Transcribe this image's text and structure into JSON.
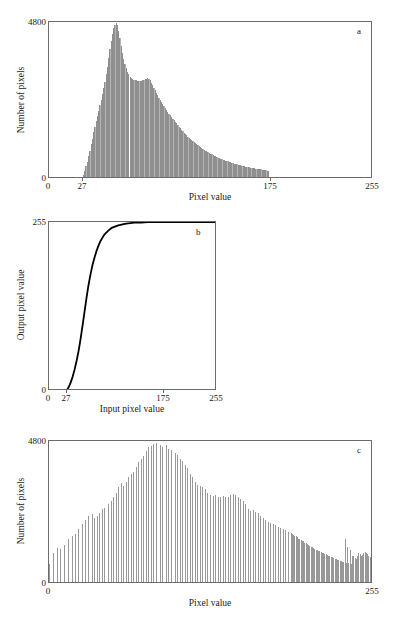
{
  "figure": {
    "panels": [
      "a",
      "b",
      "c"
    ],
    "bar_color": "#989898",
    "axis_color": "#6b6b6b",
    "curve_color": "#000000"
  },
  "chart_data": [
    {
      "id": "a",
      "type": "bar",
      "title": "",
      "panel_label": "a",
      "xlabel": "Pixel value",
      "ylabel": "Number of pixels",
      "xlim": [
        0,
        255
      ],
      "ylim": [
        0,
        4800
      ],
      "xticks": [
        0,
        27,
        175,
        255
      ],
      "xticklabels": [
        "0",
        "27",
        "175",
        "255"
      ],
      "yticks": [
        0,
        4800
      ],
      "yticklabels": [
        "0",
        "4800"
      ],
      "grid": false,
      "legend": "none",
      "description": "Original image histogram: values confined between 27 and 175, sharp peak near 53 reaching nearly 4800, secondary shoulder near 78, long tail to 175.",
      "x": [
        0,
        1,
        2,
        3,
        4,
        5,
        6,
        7,
        8,
        9,
        10,
        11,
        12,
        13,
        14,
        15,
        16,
        17,
        18,
        19,
        20,
        21,
        22,
        23,
        24,
        25,
        26,
        27,
        28,
        29,
        30,
        31,
        32,
        33,
        34,
        35,
        36,
        37,
        38,
        39,
        40,
        41,
        42,
        43,
        44,
        45,
        46,
        47,
        48,
        49,
        50,
        51,
        52,
        53,
        54,
        55,
        56,
        57,
        58,
        59,
        60,
        61,
        62,
        63,
        64,
        65,
        66,
        67,
        68,
        69,
        70,
        71,
        72,
        73,
        74,
        75,
        76,
        77,
        78,
        79,
        80,
        81,
        82,
        83,
        84,
        85,
        86,
        87,
        88,
        89,
        90,
        91,
        92,
        93,
        94,
        95,
        96,
        97,
        98,
        99,
        100,
        101,
        102,
        103,
        104,
        105,
        106,
        107,
        108,
        109,
        110,
        111,
        112,
        113,
        114,
        115,
        116,
        117,
        118,
        119,
        120,
        121,
        122,
        123,
        124,
        125,
        126,
        127,
        128,
        129,
        130,
        131,
        132,
        133,
        134,
        135,
        136,
        137,
        138,
        139,
        140,
        141,
        142,
        143,
        144,
        145,
        146,
        147,
        148,
        149,
        150,
        151,
        152,
        153,
        154,
        155,
        156,
        157,
        158,
        159,
        160,
        161,
        162,
        163,
        164,
        165,
        166,
        167,
        168,
        169,
        170,
        171,
        172,
        173,
        174,
        175,
        176,
        177,
        178,
        179,
        180,
        181,
        182,
        183,
        184,
        185,
        186,
        187,
        188,
        189,
        190,
        191,
        192,
        193,
        194,
        195,
        196,
        197,
        198,
        199,
        200,
        201,
        202,
        203,
        204,
        205,
        206,
        207,
        208,
        209,
        210,
        211,
        212,
        213,
        214,
        215,
        216,
        217,
        218,
        219,
        220,
        221,
        222,
        223,
        224,
        225,
        226,
        227,
        228,
        229,
        230,
        231,
        232,
        233,
        234,
        235,
        236,
        237,
        238,
        239,
        240,
        241,
        242,
        243,
        244,
        245,
        246,
        247,
        248,
        249,
        250,
        251,
        252,
        253,
        254,
        255
      ],
      "values": [
        0,
        0,
        0,
        0,
        0,
        0,
        0,
        0,
        0,
        0,
        0,
        0,
        0,
        0,
        0,
        0,
        0,
        0,
        0,
        0,
        0,
        0,
        0,
        0,
        0,
        0,
        0,
        60,
        190,
        330,
        470,
        640,
        820,
        1010,
        1190,
        1380,
        1560,
        1720,
        1880,
        2050,
        2220,
        2400,
        2560,
        2750,
        2950,
        3180,
        3420,
        3680,
        3950,
        4220,
        4440,
        4600,
        4720,
        4780,
        4700,
        4520,
        4300,
        4070,
        3850,
        3660,
        3500,
        3370,
        3260,
        3180,
        3110,
        3060,
        3030,
        3010,
        3000,
        2990,
        2985,
        2980,
        2980,
        2985,
        2995,
        3010,
        3030,
        3050,
        3060,
        3040,
        2990,
        2920,
        2840,
        2760,
        2680,
        2600,
        2530,
        2460,
        2390,
        2320,
        2250,
        2190,
        2130,
        2070,
        2010,
        1960,
        1910,
        1860,
        1810,
        1760,
        1710,
        1660,
        1610,
        1560,
        1510,
        1465,
        1420,
        1375,
        1330,
        1290,
        1250,
        1215,
        1180,
        1145,
        1110,
        1080,
        1050,
        1020,
        990,
        960,
        930,
        900,
        872,
        845,
        820,
        795,
        770,
        745,
        720,
        700,
        680,
        660,
        640,
        622,
        604,
        588,
        572,
        556,
        540,
        525,
        510,
        496,
        482,
        468,
        455,
        442,
        430,
        418,
        406,
        395,
        384,
        373,
        362,
        352,
        342,
        333,
        324,
        315,
        306,
        298,
        290,
        282,
        275,
        268,
        261,
        254,
        247,
        240,
        233,
        226,
        219,
        212,
        205,
        198,
        190,
        0,
        0,
        0,
        0,
        0,
        0,
        0,
        0,
        0,
        0,
        0,
        0,
        0,
        0,
        0,
        0,
        0,
        0,
        0,
        0,
        0,
        0,
        0,
        0,
        0,
        0,
        0,
        0,
        0,
        0,
        0,
        0,
        0,
        0,
        0,
        0,
        0,
        0,
        0,
        0,
        0,
        0,
        0,
        0,
        0,
        0,
        0,
        0,
        0,
        0,
        0,
        0,
        0,
        0,
        0,
        0,
        0,
        0,
        0,
        0,
        0,
        0,
        0,
        0,
        0,
        0,
        0,
        0,
        0,
        0,
        0,
        0,
        0,
        0,
        0,
        0,
        0,
        0,
        0,
        0
      ]
    },
    {
      "id": "b",
      "type": "line",
      "title": "",
      "panel_label": "b",
      "xlabel": "Input pixel value",
      "ylabel": "Output pixel value",
      "xlim": [
        0,
        255
      ],
      "ylim": [
        0,
        255
      ],
      "xticks": [
        0,
        27,
        175,
        255
      ],
      "xticklabels": [
        "0",
        "27",
        "175",
        "255"
      ],
      "yticks": [
        0,
        255
      ],
      "yticklabels": [
        "0",
        "255"
      ],
      "grid": false,
      "legend": "none",
      "description": "Cumulative distribution / transfer function: flat at 0 until 27, steep sigmoidal rise, saturating at 255 by input value 175.",
      "x": [
        0,
        5,
        10,
        15,
        20,
        25,
        27,
        30,
        33,
        36,
        39,
        42,
        45,
        48,
        51,
        54,
        57,
        60,
        63,
        66,
        69,
        72,
        75,
        78,
        81,
        84,
        87,
        90,
        95,
        100,
        105,
        110,
        115,
        120,
        130,
        140,
        150,
        160,
        170,
        175,
        185,
        200,
        220,
        240,
        255
      ],
      "values": [
        0,
        0,
        0,
        0,
        0,
        0,
        1,
        6,
        13,
        22,
        33,
        46,
        61,
        79,
        99,
        120,
        141,
        160,
        176,
        190,
        201,
        211,
        219,
        226,
        231,
        236,
        239,
        242,
        246,
        248,
        250,
        251,
        252,
        253,
        254,
        254,
        255,
        255,
        255,
        255,
        255,
        255,
        255,
        255,
        255
      ]
    },
    {
      "id": "c",
      "type": "bar",
      "title": "",
      "panel_label": "c",
      "xlabel": "Pixel value",
      "ylabel": "Number of pixels",
      "xlim": [
        0,
        255
      ],
      "ylim": [
        0,
        4800
      ],
      "xticks": [
        0,
        255
      ],
      "xticklabels": [
        "0",
        "255"
      ],
      "yticks": [
        0,
        4800
      ],
      "yticklabels": [
        "0",
        "4800"
      ],
      "grid": false,
      "legend": "none",
      "description": "Histogram-equalised image: sparse comb of tall isolated spikes spread across the whole 0-255 range, rising to a maximum near 4700 around value 95, then tapering, with a dense band of short bars after about value 215.",
      "x": [
        0,
        1,
        2,
        3,
        4,
        5,
        6,
        7,
        8,
        9,
        10,
        11,
        12,
        13,
        14,
        15,
        16,
        17,
        18,
        19,
        20,
        21,
        22,
        23,
        24,
        25,
        26,
        27,
        28,
        29,
        30,
        31,
        32,
        33,
        34,
        35,
        36,
        37,
        38,
        39,
        40,
        41,
        42,
        43,
        44,
        45,
        46,
        47,
        48,
        49,
        50,
        51,
        52,
        53,
        54,
        55,
        56,
        57,
        58,
        59,
        60,
        61,
        62,
        63,
        64,
        65,
        66,
        67,
        68,
        69,
        70,
        71,
        72,
        73,
        74,
        75,
        76,
        77,
        78,
        79,
        80,
        81,
        82,
        83,
        84,
        85,
        86,
        87,
        88,
        89,
        90,
        91,
        92,
        93,
        94,
        95,
        96,
        97,
        98,
        99,
        100,
        101,
        102,
        103,
        104,
        105,
        106,
        107,
        108,
        109,
        110,
        111,
        112,
        113,
        114,
        115,
        116,
        117,
        118,
        119,
        120,
        121,
        122,
        123,
        124,
        125,
        126,
        127,
        128,
        129,
        130,
        131,
        132,
        133,
        134,
        135,
        136,
        137,
        138,
        139,
        140,
        141,
        142,
        143,
        144,
        145,
        146,
        147,
        148,
        149,
        150,
        151,
        152,
        153,
        154,
        155,
        156,
        157,
        158,
        159,
        160,
        161,
        162,
        163,
        164,
        165,
        166,
        167,
        168,
        169,
        170,
        171,
        172,
        173,
        174,
        175,
        176,
        177,
        178,
        179,
        180,
        181,
        182,
        183,
        184,
        185,
        186,
        187,
        188,
        189,
        190,
        191,
        192,
        193,
        194,
        195,
        196,
        197,
        198,
        199,
        200,
        201,
        202,
        203,
        204,
        205,
        206,
        207,
        208,
        209,
        210,
        211,
        212,
        213,
        214,
        215,
        216,
        217,
        218,
        219,
        220,
        221,
        222,
        223,
        224,
        225,
        226,
        227,
        228,
        229,
        230,
        231,
        232,
        233,
        234,
        235,
        236,
        237,
        238,
        239,
        240,
        241,
        242,
        243,
        244,
        245,
        246,
        247,
        248,
        249,
        250,
        251,
        252,
        253,
        254,
        255
      ],
      "values": [
        620,
        0,
        0,
        980,
        0,
        0,
        1150,
        0,
        0,
        1120,
        0,
        0,
        1260,
        0,
        0,
        1450,
        0,
        0,
        1560,
        0,
        0,
        1640,
        0,
        1820,
        0,
        0,
        1980,
        0,
        0,
        2100,
        0,
        2260,
        0,
        0,
        2310,
        0,
        2180,
        0,
        2250,
        0,
        2360,
        0,
        2480,
        0,
        2520,
        0,
        0,
        2640,
        0,
        2760,
        0,
        2880,
        0,
        3020,
        0,
        3240,
        0,
        3380,
        0,
        3280,
        0,
        3420,
        0,
        3560,
        0,
        3680,
        0,
        3740,
        0,
        3920,
        0,
        4080,
        0,
        4180,
        0,
        4300,
        0,
        4460,
        0,
        4580,
        0,
        4620,
        0,
        4700,
        0,
        4720,
        0,
        0,
        4660,
        0,
        4600,
        0,
        0,
        4680,
        0,
        4540,
        0,
        4480,
        0,
        0,
        4400,
        0,
        4320,
        0,
        4200,
        0,
        4120,
        0,
        3980,
        0,
        3880,
        0,
        3680,
        0,
        3560,
        0,
        3420,
        0,
        3300,
        0,
        3260,
        0,
        3240,
        0,
        3180,
        0,
        3020,
        0,
        2960,
        0,
        2940,
        0,
        2960,
        0,
        2880,
        0,
        2900,
        0,
        2920,
        0,
        2900,
        0,
        2880,
        0,
        2960,
        0,
        2980,
        0,
        2960,
        0,
        2900,
        0,
        2820,
        0,
        2760,
        0,
        2640,
        0,
        2480,
        0,
        2420,
        0,
        2460,
        0,
        2380,
        0,
        2340,
        0,
        2260,
        0,
        2180,
        0,
        2120,
        0,
        2060,
        0,
        2020,
        0,
        1980,
        0,
        1940,
        0,
        1880,
        0,
        1840,
        0,
        1800,
        0,
        1760,
        0,
        1700,
        0,
        1660,
        1640,
        1600,
        1580,
        1560,
        1520,
        1480,
        1460,
        1420,
        1400,
        1380,
        1340,
        1320,
        1280,
        1260,
        1240,
        1200,
        1180,
        1160,
        1140,
        1100,
        1080,
        1060,
        1040,
        1020,
        1000,
        980,
        960,
        940,
        920,
        900,
        880,
        860,
        840,
        820,
        800,
        780,
        760,
        740,
        720,
        700,
        690,
        680,
        1480,
        660,
        1200,
        640,
        1100,
        620,
        900,
        880,
        820,
        800,
        900,
        1000,
        950,
        880,
        920,
        980,
        1020,
        980,
        940,
        900,
        860,
        820,
        800,
        760,
        740
      ]
    }
  ]
}
